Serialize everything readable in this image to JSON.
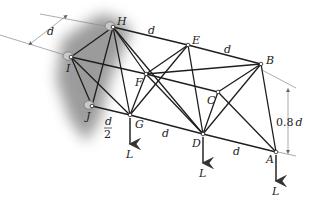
{
  "figure": {
    "nodes": {
      "H": {
        "label": "H",
        "x": 113,
        "y": 27
      },
      "I": {
        "label": "I",
        "x": 71,
        "y": 57
      },
      "J": {
        "label": "J",
        "x": 92,
        "y": 106
      },
      "G": {
        "label": "G",
        "x": 130,
        "y": 115
      },
      "F": {
        "label": "F",
        "x": 146,
        "y": 74
      },
      "E": {
        "label": "E",
        "x": 188,
        "y": 45
      },
      "C": {
        "label": "C",
        "x": 218,
        "y": 92
      },
      "D": {
        "label": "D",
        "x": 203,
        "y": 134
      },
      "B": {
        "label": "B",
        "x": 261,
        "y": 64
      },
      "A": {
        "label": "A",
        "x": 276,
        "y": 152
      }
    },
    "members": [
      [
        "H",
        "E"
      ],
      [
        "E",
        "B"
      ],
      [
        "I",
        "F"
      ],
      [
        "F",
        "C"
      ],
      [
        "J",
        "G"
      ],
      [
        "G",
        "D"
      ],
      [
        "D",
        "A"
      ],
      [
        "H",
        "I"
      ],
      [
        "I",
        "J"
      ],
      [
        "H",
        "J"
      ],
      [
        "I",
        "G"
      ],
      [
        "H",
        "G"
      ],
      [
        "H",
        "F"
      ],
      [
        "F",
        "G"
      ],
      [
        "E",
        "G"
      ],
      [
        "F",
        "D"
      ],
      [
        "E",
        "F"
      ],
      [
        "E",
        "D"
      ],
      [
        "F",
        "B"
      ],
      [
        "C",
        "D"
      ],
      [
        "C",
        "B"
      ],
      [
        "D",
        "B"
      ],
      [
        "C",
        "A"
      ],
      [
        "B",
        "A"
      ],
      [
        "H",
        "D"
      ]
    ],
    "supports": [
      "H",
      "I",
      "J"
    ],
    "loads": [
      {
        "node": "G",
        "label": "L"
      },
      {
        "node": "D",
        "label": "L"
      },
      {
        "node": "A",
        "label": "L"
      }
    ],
    "dimensions": {
      "top_left": "d",
      "H_E": "d",
      "E_B": "d",
      "J_G_num": "d",
      "J_G_den": "2",
      "G_D": "d",
      "D_A": "d",
      "height_num": "0.8",
      "height_var": "d"
    },
    "colors": {
      "member": "#1e1e1e",
      "shadow": "#8a8a8a",
      "dimension": "#888888"
    }
  }
}
